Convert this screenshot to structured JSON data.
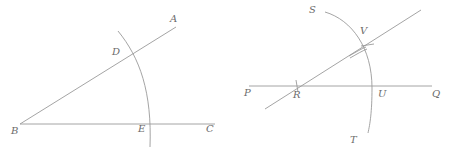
{
  "figure": {
    "caption": "",
    "stroke_color": "#9a9a9a",
    "label_color": "#6b6b6b",
    "background": "#ffffff",
    "width": 458,
    "height": 153
  },
  "left_figure": {
    "name": "angle-abc-with-arc",
    "labels": {
      "A": "A",
      "B": "B",
      "C": "C",
      "D": "D",
      "E": "E"
    },
    "points": {
      "B": [
        20,
        124
      ],
      "A_end": [
        176,
        27
      ],
      "C_end": [
        215,
        124
      ],
      "D": [
        135,
        55
      ],
      "E": [
        150,
        124
      ]
    },
    "arc": {
      "start": [
        118,
        31
      ],
      "end": [
        150,
        147
      ]
    }
  },
  "right_figure": {
    "name": "line-pq-with-ray-and-arc",
    "labels": {
      "P": "P",
      "Q": "Q",
      "R": "R",
      "S": "S",
      "T": "T",
      "U": "U",
      "V": "V"
    },
    "points": {
      "P_end": [
        249,
        86
      ],
      "Q_end": [
        432,
        86
      ],
      "R": [
        297,
        86
      ],
      "ray_low": [
        265,
        109
      ],
      "ray_high": [
        421,
        10
      ],
      "V": [
        365,
        45
      ],
      "U": [
        375,
        86
      ]
    },
    "arc": {
      "start": [
        325,
        12
      ],
      "end": [
        368,
        133
      ]
    },
    "tick_marks": [
      {
        "name": "tick-at-r",
        "at": [
          297,
          86
        ]
      },
      {
        "name": "tick-at-v",
        "at": [
          365,
          45
        ]
      }
    ]
  }
}
